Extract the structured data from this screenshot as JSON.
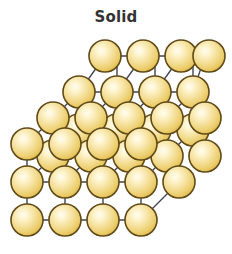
{
  "figure": {
    "title": "Solid",
    "title_color": "#333333",
    "background_color": "#ffffff",
    "width": 232,
    "height": 254
  },
  "diagram": {
    "name": "solid-crystal-lattice",
    "particle_count": 30,
    "sphere": {
      "radius": 16,
      "outline_color": "#5f4a18",
      "outline_width": 1.6,
      "fill_center_color": "#fdf7dc",
      "fill_mid_color": "#f3dd92",
      "fill_edge_color": "#e3bf52"
    },
    "bond": {
      "color": "#3f4250",
      "width": 1.4,
      "diagonal_color": "#3f4250",
      "diagonal_width": 1.3
    },
    "layout": {
      "columns": 4,
      "rows": 4,
      "depth": 3,
      "front_origin_x": 27,
      "front_origin_y": 220,
      "spacing_x": 38,
      "spacing_y": 38,
      "depth_offset_x": 26,
      "depth_offset_y": -26
    },
    "nodes": [
      {
        "id": "f-0-0",
        "x": 27,
        "y": 220,
        "layer": "front"
      },
      {
        "id": "f-1-0",
        "x": 65,
        "y": 220,
        "layer": "front"
      },
      {
        "id": "f-2-0",
        "x": 103,
        "y": 220,
        "layer": "front"
      },
      {
        "id": "f-3-0",
        "x": 141,
        "y": 220,
        "layer": "front"
      },
      {
        "id": "f-0-1",
        "x": 27,
        "y": 182,
        "layer": "front"
      },
      {
        "id": "f-1-1",
        "x": 65,
        "y": 182,
        "layer": "front"
      },
      {
        "id": "f-2-1",
        "x": 103,
        "y": 182,
        "layer": "front"
      },
      {
        "id": "f-3-1",
        "x": 141,
        "y": 182,
        "layer": "front"
      },
      {
        "id": "f-0-2",
        "x": 27,
        "y": 144,
        "layer": "front"
      },
      {
        "id": "f-1-2",
        "x": 65,
        "y": 144,
        "layer": "front"
      },
      {
        "id": "f-2-2",
        "x": 103,
        "y": 144,
        "layer": "front"
      },
      {
        "id": "f-3-2",
        "x": 141,
        "y": 144,
        "layer": "front"
      },
      {
        "id": "m-0-1",
        "x": 53,
        "y": 156,
        "layer": "middle"
      },
      {
        "id": "m-1-1",
        "x": 91,
        "y": 156,
        "layer": "middle"
      },
      {
        "id": "m-2-1",
        "x": 129,
        "y": 156,
        "layer": "middle"
      },
      {
        "id": "m-3-1",
        "x": 167,
        "y": 156,
        "layer": "middle"
      },
      {
        "id": "m-0-2",
        "x": 53,
        "y": 118,
        "layer": "middle"
      },
      {
        "id": "m-1-2",
        "x": 91,
        "y": 118,
        "layer": "middle"
      },
      {
        "id": "m-2-2",
        "x": 129,
        "y": 118,
        "layer": "middle"
      },
      {
        "id": "m-3-2",
        "x": 167,
        "y": 118,
        "layer": "middle"
      },
      {
        "id": "b-0-1",
        "x": 79,
        "y": 130,
        "layer": "back"
      },
      {
        "id": "b-1-1",
        "x": 117,
        "y": 130,
        "layer": "back"
      },
      {
        "id": "b-2-1",
        "x": 155,
        "y": 130,
        "layer": "back"
      },
      {
        "id": "b-3-1",
        "x": 193,
        "y": 130,
        "layer": "back"
      },
      {
        "id": "b-0-2",
        "x": 79,
        "y": 92,
        "layer": "back"
      },
      {
        "id": "b-1-2",
        "x": 117,
        "y": 92,
        "layer": "back"
      },
      {
        "id": "b-2-2",
        "x": 155,
        "y": 92,
        "layer": "back"
      },
      {
        "id": "b-3-2",
        "x": 193,
        "y": 92,
        "layer": "back"
      },
      {
        "id": "b-0-3",
        "x": 105,
        "y": 56,
        "layer": "back"
      },
      {
        "id": "b-1-3",
        "x": 143,
        "y": 56,
        "layer": "back"
      },
      {
        "id": "b-2-3",
        "x": 181,
        "y": 56,
        "layer": "back"
      },
      {
        "id": "b-3-3",
        "x": 205,
        "y": 56,
        "layer": "back"
      }
    ]
  }
}
